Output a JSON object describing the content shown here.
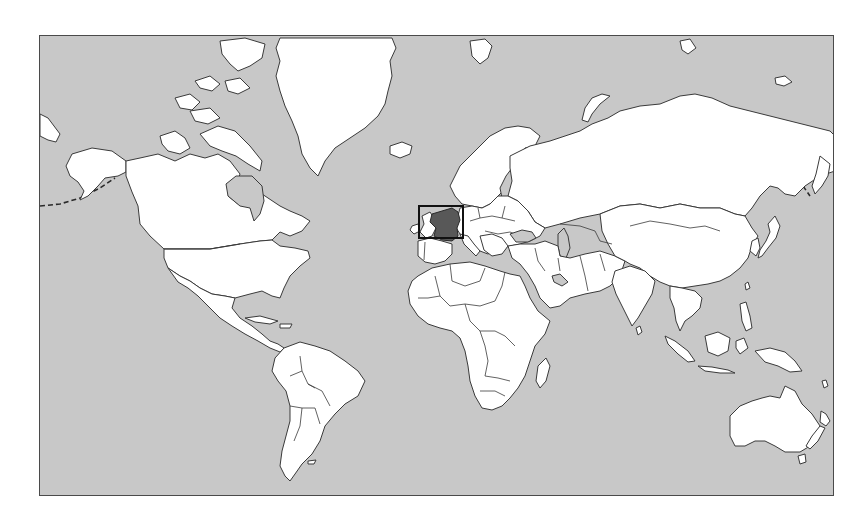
{
  "map": {
    "title": "World map",
    "projection": "Mercator",
    "highlighted_country": "France",
    "colors": {
      "ocean": "#c8c8c8",
      "land": "#ffffff",
      "outline": "#3a3a3a",
      "highlight": "#585858",
      "selection_box": "#111111"
    },
    "selection_box": {
      "x": 418,
      "y": 205,
      "width": 44,
      "height": 32
    }
  }
}
